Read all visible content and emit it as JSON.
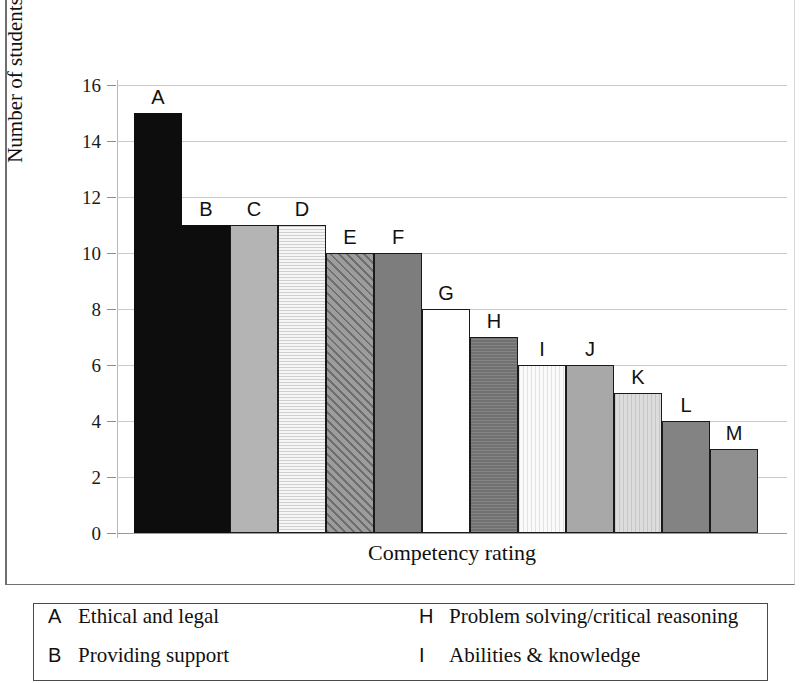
{
  "chart_data": {
    "type": "bar",
    "title": "",
    "xlabel": "Competency rating",
    "ylabel": "Number of students",
    "categories": [
      "A",
      "B",
      "C",
      "D",
      "E",
      "F",
      "G",
      "H",
      "I",
      "J",
      "K",
      "L",
      "M"
    ],
    "values": [
      15,
      11,
      11,
      11,
      10,
      10,
      8,
      7,
      6,
      6,
      5,
      4,
      3
    ],
    "ylim": [
      0,
      16
    ],
    "ytick_labels": [
      "16",
      "14",
      "12",
      "10",
      "8",
      "6",
      "4",
      "2",
      "0"
    ],
    "ytick_values": [
      16,
      14,
      12,
      10,
      8,
      6,
      4,
      2,
      0
    ],
    "ystep": 2,
    "grid": true,
    "legend_position": "below-plot",
    "bar_fills": [
      "solid-black",
      "solid-black",
      "solid-medium-gray",
      "horizontal-stripes-light",
      "diagonal-hatch-dark",
      "solid-dark-gray",
      "solid-white",
      "textured-dark-gray",
      "very-light-vertical-texture",
      "solid-medium-gray",
      "light-gray-vertical-texture",
      "solid-dark-gray",
      "solid-medium-dark-gray"
    ]
  },
  "legend": {
    "left_column": [
      {
        "key": "A",
        "description": "Ethical and legal"
      },
      {
        "key": "B",
        "description": "Providing support"
      }
    ],
    "right_column": [
      {
        "key": "H",
        "description": "Problem solving/critical reasoning"
      },
      {
        "key": "I",
        "description": "Abilities & knowledge"
      }
    ]
  },
  "colors": {
    "black": "#0d0d0d",
    "medium_gray": "#b4b4b4",
    "dark_gray": "#7d7d7d",
    "light_gray": "#d3d3d3",
    "very_light_gray": "#f0f0f0",
    "gridline": "#c9c9c9",
    "text": "#111111"
  }
}
